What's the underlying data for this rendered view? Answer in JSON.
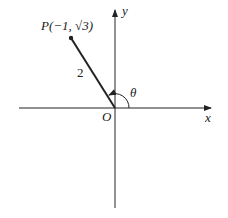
{
  "diagram": {
    "point_label": "P(−1, √3)",
    "segment_length_label": "2",
    "angle_label": "θ",
    "origin_label": "O",
    "x_axis_label": "x",
    "y_axis_label": "y"
  },
  "colors": {
    "stroke": "#222222",
    "background": "#ffffff"
  }
}
